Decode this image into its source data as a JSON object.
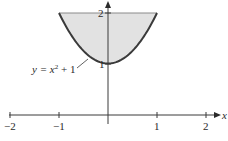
{
  "chart_data": {
    "type": "area",
    "title": "",
    "xlabel": "x",
    "ylabel": "",
    "xlim": [
      -2,
      2
    ],
    "ylim": [
      0,
      2
    ],
    "grid": false,
    "legend": null,
    "x_ticks": [
      -2,
      -1,
      1,
      2
    ],
    "x_tick_labels": [
      "−2",
      "−1",
      "1",
      "2"
    ],
    "y_ticks": [
      1,
      2
    ],
    "y_tick_labels": [
      "1",
      "2"
    ],
    "series": [
      {
        "name": "y = x² + 1",
        "type": "line",
        "function": "x^2 + 1",
        "x": [
          -1,
          -0.75,
          -0.5,
          -0.25,
          0,
          0.25,
          0.5,
          0.75,
          1
        ],
        "y": [
          2,
          1.5625,
          1.25,
          1.0625,
          1,
          1.0625,
          1.25,
          1.5625,
          2
        ]
      }
    ],
    "shaded_region": {
      "description": "Region bounded below by y = x² + 1 and above by y = 2, for -1 ≤ x ≤ 1",
      "lower": "x^2 + 1",
      "upper": "2",
      "x_range": [
        -1,
        1
      ],
      "fill_color": "#e2e2e2"
    },
    "annotations": [
      {
        "text": "y = x² + 1",
        "points_to": [
          -0.45,
          1.2
        ]
      }
    ]
  },
  "labels": {
    "x_axis": "x",
    "curve_label_prefix": "y = x",
    "curve_label_exp": "2",
    "curve_label_suffix": " + 1",
    "xt_m2": "−2",
    "xt_m1": "−1",
    "xt_1": "1",
    "xt_2": "2",
    "yt_1": "1",
    "yt_2": "2"
  },
  "colors": {
    "fill": "#e2e2e2",
    "curve": "#3a3a3a",
    "axis": "#3a3a3a"
  }
}
